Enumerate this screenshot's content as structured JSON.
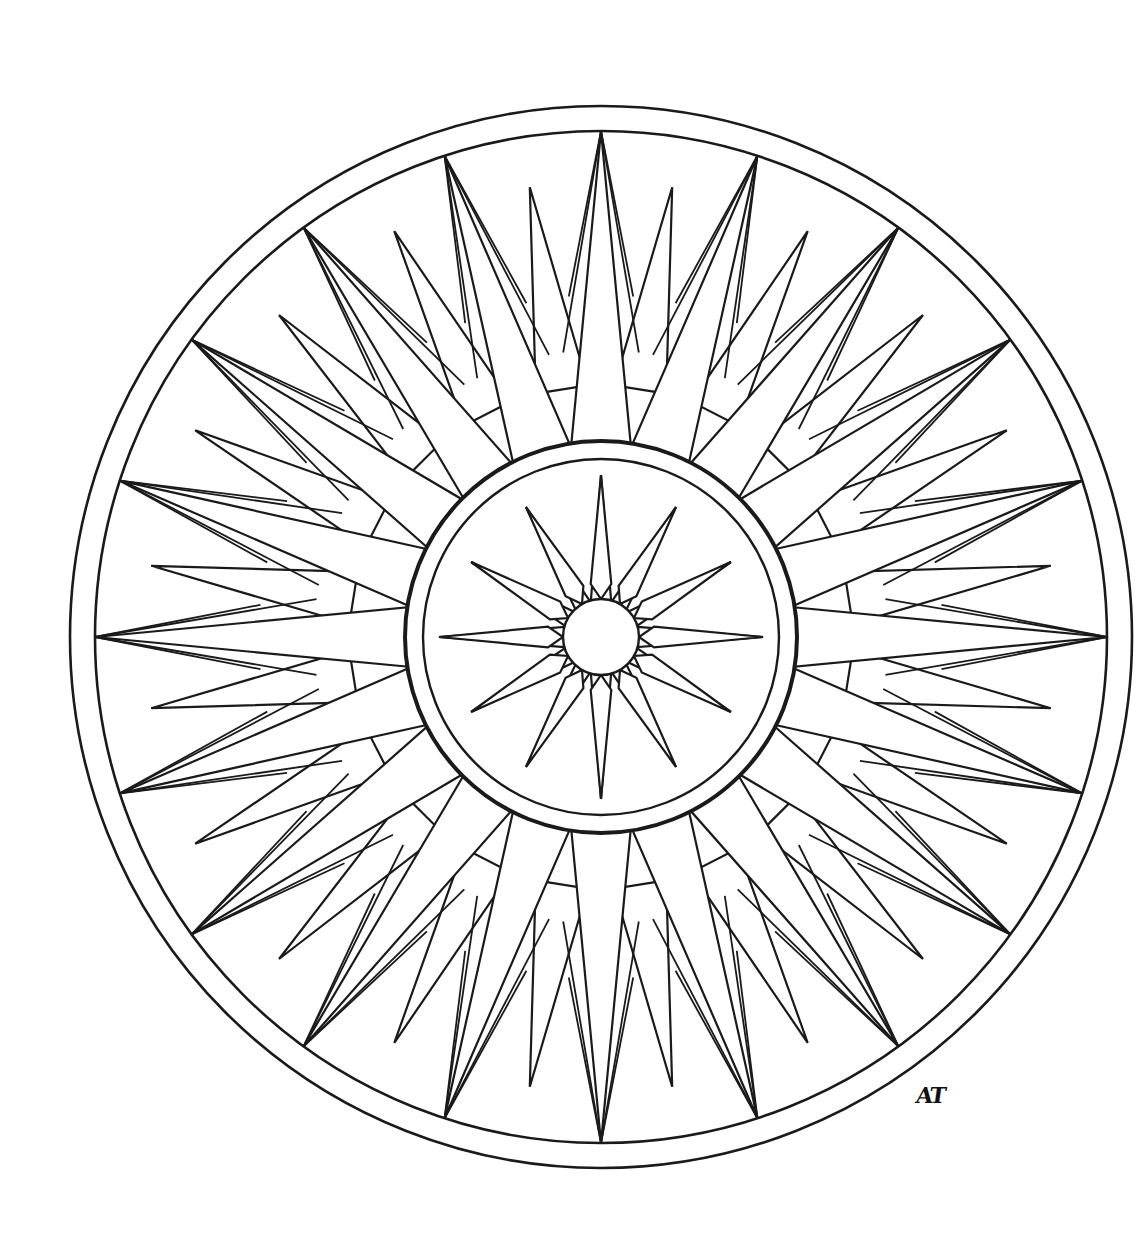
{
  "artwork": {
    "title": "Compass rose mandala coloring page",
    "signature": "AT",
    "stroke_color": "#1a1a1a",
    "background_color": "#ffffff",
    "center": [
      601,
      637
    ],
    "outer_ring_radius": 531,
    "inner_ring_radius": 506,
    "medallion_outer_radius": 196,
    "medallion_inner_radius": 178,
    "hub_radius": 38,
    "outer_ray_count": 20,
    "inner_star_points": 12
  }
}
